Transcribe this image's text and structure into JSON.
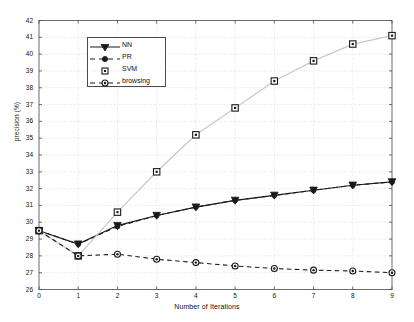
{
  "chart_data": {
    "type": "line",
    "title": "",
    "xlabel": "Number of Iterations",
    "ylabel": "precision (%)",
    "xlim": [
      0,
      9
    ],
    "ylim": [
      26,
      42
    ],
    "xticks": [
      0,
      1,
      2,
      3,
      4,
      5,
      6,
      7,
      8,
      9
    ],
    "yticks": [
      26,
      27,
      28,
      29,
      30,
      31,
      32,
      33,
      34,
      35,
      36,
      37,
      38,
      39,
      40,
      41,
      42
    ],
    "grid": true,
    "legend_position": "upper-left-inside",
    "x": [
      0,
      1,
      2,
      3,
      4,
      5,
      6,
      7,
      8,
      9
    ],
    "series": [
      {
        "name": "NN",
        "marker": "triangle-down",
        "linestyle": "solid",
        "color": "#1a1a1a",
        "values": [
          29.5,
          28.7,
          29.8,
          30.4,
          30.9,
          31.3,
          31.6,
          31.9,
          32.2,
          32.4
        ]
      },
      {
        "name": "PR",
        "marker": "circle-filled",
        "linestyle": "dashed",
        "color": "#1a1a1a",
        "values": [
          29.5,
          28.7,
          29.75,
          30.4,
          30.9,
          31.3,
          31.6,
          31.9,
          32.2,
          32.4
        ]
      },
      {
        "name": "SVM",
        "marker": "square",
        "linestyle": "solid",
        "color": "#c9c9c9",
        "values": [
          29.5,
          28.0,
          30.6,
          33.0,
          35.2,
          36.8,
          38.4,
          39.6,
          40.6,
          41.1
        ]
      },
      {
        "name": "browsing",
        "marker": "circle-dot",
        "linestyle": "dashed",
        "color": "#1a1a1a",
        "values": [
          29.5,
          28.0,
          28.1,
          27.8,
          27.6,
          27.4,
          27.25,
          27.15,
          27.1,
          27.0
        ]
      }
    ]
  },
  "legend": {
    "entries": [
      {
        "label": "NN"
      },
      {
        "label": "PR"
      },
      {
        "label": "SVM"
      },
      {
        "label": "browsing"
      }
    ]
  },
  "axis": {
    "ylabel": "precision (%)",
    "xlabel": "Number of Iterations"
  }
}
